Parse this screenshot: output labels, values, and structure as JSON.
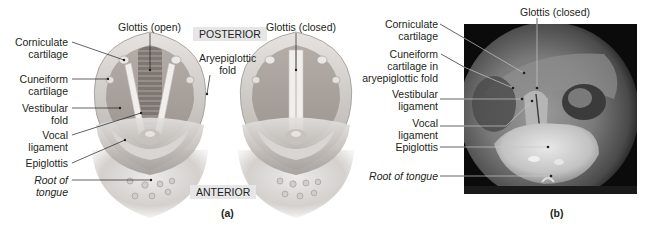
{
  "figure": {
    "panel_a": {
      "caption": "(a)",
      "orientation": {
        "top": "POSTERIOR",
        "bottom": "ANTERIOR"
      },
      "labels_left": [
        {
          "line1": "Corniculate",
          "line2": "cartilage"
        },
        {
          "line1": "Cuneiform",
          "line2": "cartilage"
        },
        {
          "line1": "Vestibular",
          "line2": "fold"
        },
        {
          "line1": "Vocal",
          "line2": "ligament"
        },
        {
          "line1": "Epiglottis",
          "line2": ""
        },
        {
          "line1": "Root of",
          "line2": "tongue",
          "italic": true
        }
      ],
      "label_glottis_open": "Glottis (open)",
      "label_aryepiglottic": {
        "line1": "Aryepiglottic",
        "line2": "fold"
      },
      "label_glottis_closed": "Glottis (closed)"
    },
    "panel_b": {
      "caption": "(b)",
      "label_glottis_closed": "Glottis (closed)",
      "labels_left": [
        {
          "line1": "Corniculate",
          "line2": "cartilage"
        },
        {
          "line1": "Cuneiform",
          "line2": "cartilage in",
          "line3": "aryepiglottic fold"
        },
        {
          "line1": "Vestibular",
          "line2": "ligament"
        },
        {
          "line1": "Vocal",
          "line2": "ligament"
        },
        {
          "line1": "Epiglottis"
        },
        {
          "line1": "Root of tongue",
          "italic": true
        }
      ]
    },
    "colors": {
      "tissue_light": "#d9d6d3",
      "tissue_mid": "#b9b4b0",
      "tissue_dark": "#8e8782",
      "cord_white": "#f1efec",
      "tag_bg": "#e6e6e7",
      "photo_bg": "#0b0b0b",
      "leader_line": "#231f20",
      "photo_leader_line": "#bfbfbf"
    }
  }
}
